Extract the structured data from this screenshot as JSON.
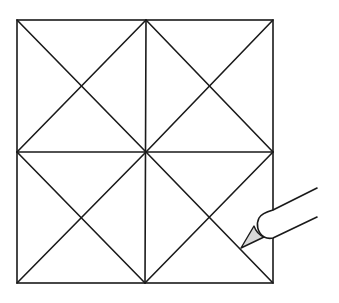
{
  "diagram": {
    "grid": {
      "rows": 2,
      "cols": 2,
      "left": 17,
      "top": 20,
      "right": 273,
      "bottom": 283
    },
    "line_color": "#1a1a1a",
    "pencil_tip_color": "#d9d9d9",
    "icons": [
      "pencil-icon"
    ]
  }
}
